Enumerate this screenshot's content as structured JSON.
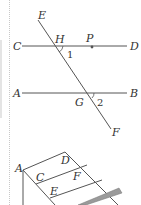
{
  "figure1": {
    "labels": {
      "E": "E",
      "C": "C",
      "H": "H",
      "P": "P",
      "D": "D",
      "angle1": "1",
      "A": "A",
      "G": "G",
      "angle2": "2",
      "B": "B",
      "F": "F"
    }
  },
  "figure2": {
    "labels": {
      "A": "A",
      "C": "C",
      "D": "D",
      "E": "E",
      "F": "F"
    },
    "bar_color": "#9a9a9a"
  },
  "colors": {
    "line": "#555555",
    "text": "#333333"
  }
}
